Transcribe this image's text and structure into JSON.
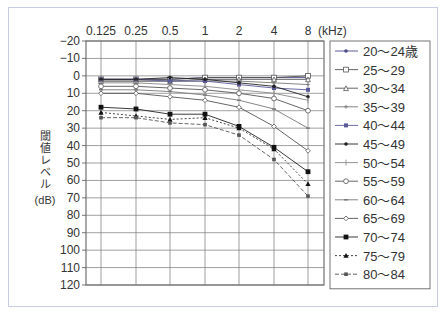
{
  "chart_data": {
    "type": "line",
    "title": "",
    "xlabel": "(kHz)",
    "ylabel": "閾値レベル(dB)",
    "x_position": "top",
    "y_inverted": true,
    "categories": [
      "0.125",
      "0.25",
      "0.5",
      "1",
      "2",
      "4",
      "8"
    ],
    "ylim": [
      -20,
      120
    ],
    "yticks": [
      -20,
      -10,
      0,
      10,
      20,
      30,
      40,
      50,
      60,
      70,
      80,
      90,
      100,
      110,
      120
    ],
    "grid": true,
    "legend_position": "right",
    "series": [
      {
        "name": "20〜24歳",
        "marker": "dot",
        "dash": "solid",
        "color": "#4a4a8a",
        "values": [
          2,
          2,
          2,
          1,
          1,
          1,
          1
        ]
      },
      {
        "name": "25〜29",
        "marker": "open-square",
        "dash": "solid",
        "color": "#555",
        "values": [
          2,
          2,
          2,
          1,
          1,
          1,
          0
        ]
      },
      {
        "name": "30〜34",
        "marker": "open-triangle",
        "dash": "solid",
        "color": "#555",
        "values": [
          3,
          3,
          3,
          2,
          2,
          2,
          2
        ]
      },
      {
        "name": "35〜39",
        "marker": "plus",
        "dash": "solid",
        "color": "#777",
        "values": [
          3,
          3,
          3,
          3,
          3,
          4,
          5
        ]
      },
      {
        "name": "40〜44",
        "marker": "square",
        "dash": "solid",
        "color": "#5a5a9a",
        "values": [
          2,
          2,
          3,
          3,
          5,
          7,
          8
        ]
      },
      {
        "name": "45〜49",
        "marker": "dot",
        "dash": "solid",
        "color": "#222",
        "values": [
          2,
          2,
          1,
          2,
          4,
          6,
          12
        ]
      },
      {
        "name": "50〜54",
        "marker": "tick",
        "dash": "solid",
        "color": "#888",
        "values": [
          4,
          4,
          5,
          6,
          8,
          10,
          14
        ]
      },
      {
        "name": "55〜59",
        "marker": "open-circle",
        "dash": "solid",
        "color": "#555",
        "values": [
          6,
          6,
          7,
          8,
          10,
          13,
          20
        ]
      },
      {
        "name": "60〜64",
        "marker": "dash",
        "dash": "solid",
        "color": "#777",
        "values": [
          8,
          8,
          9,
          11,
          14,
          19,
          30
        ]
      },
      {
        "name": "65〜69",
        "marker": "open-diamond",
        "dash": "solid",
        "color": "#555",
        "values": [
          10,
          10,
          12,
          14,
          18,
          29,
          43
        ]
      },
      {
        "name": "70〜74",
        "marker": "filled-square",
        "dash": "solid",
        "color": "#222",
        "values": [
          18,
          19,
          22,
          22,
          29,
          41,
          55
        ]
      },
      {
        "name": "75〜79",
        "marker": "filled-triangle",
        "dash": "dotted",
        "color": "#333",
        "values": [
          21,
          23,
          25,
          24,
          30,
          42,
          62
        ]
      },
      {
        "name": "80〜84",
        "marker": "x",
        "dash": "dashed",
        "color": "#555",
        "values": [
          24,
          24,
          27,
          28,
          34,
          48,
          69
        ]
      }
    ]
  }
}
